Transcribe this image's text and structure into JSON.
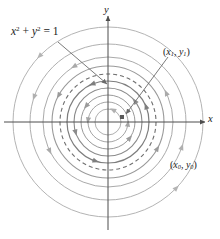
{
  "figure": {
    "background_color": "#ffffff",
    "width": 220,
    "height": 239
  },
  "labels": {
    "equation": {
      "body": "x",
      "exp1": "2",
      "plus": " + ",
      "body2": "y",
      "exp2": "2",
      "equals": " = 1"
    },
    "equation_text": "x² + y² = 1",
    "axis_x": "x",
    "axis_y": "y",
    "point_1": {
      "open": "(",
      "v1": "x",
      "s1": "1",
      "comma": ", ",
      "v2": "y",
      "s2": "1",
      "close": ")"
    },
    "point_1_text": "(x₁, y₁)",
    "point_0": {
      "open": "(",
      "v1": "x",
      "s1": "0",
      "comma": ", ",
      "v2": "y",
      "s2": "0",
      "close": ")"
    },
    "point_0_text": "(x₀, y₀)"
  },
  "colors": {
    "axis": "#4d4d4d",
    "curve_light": "#a9a9a9",
    "curve_dark": "#6b6b6b",
    "dashed": "#6f6f6f",
    "leader": "#6b6b6b",
    "text": "#1a1a1a",
    "marker": "#5a5a5a"
  },
  "chart_data": {
    "type": "scatter",
    "title": "",
    "xlabel": "x",
    "ylabel": "y",
    "grid": false,
    "legend": null,
    "origin_px": {
      "x": 108,
      "y": 122
    },
    "axes": {
      "x_axis": {
        "x1": 4,
        "x2": 207,
        "y": 122,
        "arrow": "right"
      },
      "y_axis": {
        "y1": 14,
        "y2": 230,
        "x": 108,
        "arrow": "up"
      }
    },
    "annotations": [
      {
        "name": "equation",
        "text": "x² + y² = 1",
        "x": 11,
        "y": 26,
        "points_to": "dashed-unit-circle"
      },
      {
        "name": "point-1-label",
        "text": "(x₁, y₁)",
        "x": 163,
        "y": 47,
        "points_to": "state-marker"
      },
      {
        "name": "point-0-label",
        "text": "(x₀, y₀)",
        "x": 170,
        "y": 160,
        "points_to": "outer-orbit"
      }
    ],
    "markers": [
      {
        "name": "state-marker",
        "x_px": 122,
        "y_px": 117,
        "shape": "square",
        "size": 4
      }
    ],
    "leader_lines": [
      {
        "from": [
          58,
          42
        ],
        "to": [
          107,
          84
        ],
        "arrow": true
      },
      {
        "from": [
          168,
          57
        ],
        "to": [
          126,
          114
        ],
        "arrow": true
      }
    ],
    "orbits": [
      {
        "radius_px": 95,
        "style": "solid",
        "color": "#b4b4b4",
        "width": 1.0,
        "arrows": [
          135,
          315
        ]
      },
      {
        "radius_px": 78,
        "style": "solid",
        "color": "#b0b0b0",
        "width": 1.0,
        "arrows": [
          160,
          340
        ]
      },
      {
        "radius_px": 65,
        "style": "solid",
        "color": "#aaaaaa",
        "width": 1.0,
        "arrows": [
          120,
          205,
          25
        ]
      },
      {
        "radius_px": 56,
        "style": "solid",
        "color": "#9a9a9a",
        "width": 1.1,
        "arrows": [
          150,
          330
        ]
      },
      {
        "radius_px": 48,
        "style": "dashed",
        "color": "#6f6f6f",
        "width": 1.1,
        "arrows": []
      },
      {
        "radius_px": 41,
        "style": "solid",
        "color": "#7e7e7e",
        "width": 1.2,
        "arrows": [
          110,
          250,
          20
        ]
      },
      {
        "radius_px": 34,
        "style": "solid",
        "color": "#8b8b8b",
        "width": 1.1,
        "arrows": [
          195,
          35
        ]
      },
      {
        "radius_px": 27,
        "style": "solid",
        "color": "#9a9a9a",
        "width": 1.0,
        "arrows": [
          140,
          320
        ]
      },
      {
        "radius_px": 20,
        "style": "solid",
        "color": "#a5a5a5",
        "width": 1.0,
        "arrows": [
          170,
          350
        ]
      },
      {
        "radius_px": 13,
        "style": "solid",
        "color": "#b0b0b0",
        "width": 1.0,
        "arrows": [
          60
        ]
      }
    ],
    "orbit_direction": "counterclockwise",
    "dashed_orbit_radius_px": 48,
    "note": "Concentric circular trajectories centered at the origin; dashed circle is the unit circle x^2 + y^2 = 1"
  }
}
